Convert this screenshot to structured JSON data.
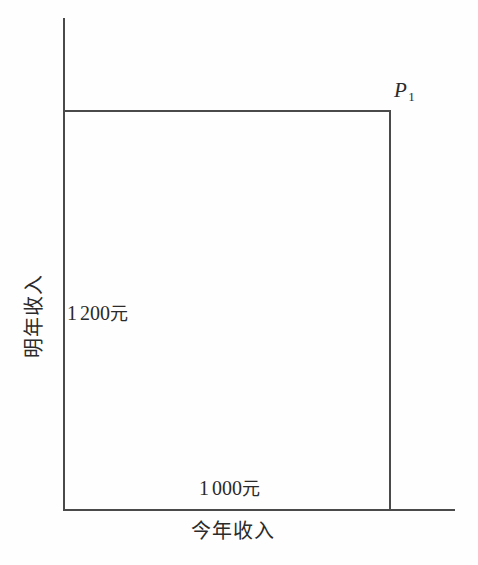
{
  "figure": {
    "background_color": "#fefefe",
    "line_color": "#4a4a4a",
    "text_color": "#2b2b2b"
  },
  "axes": {
    "x_axis_label": "今年收入",
    "y_axis_label": "明年收入"
  },
  "annotations": {
    "corner_point_base": "P",
    "corner_point_subscript": "1",
    "y_value_prefix": "1",
    "y_value_suffix": "200",
    "y_value_unit": "元",
    "x_value_prefix": "1",
    "x_value_suffix": "000",
    "x_value_unit": "元"
  },
  "chart_data": {
    "type": "line",
    "title": "",
    "subtitle": "",
    "xlabel": "今年收入",
    "ylabel": "明年收入",
    "grid": false,
    "legend": "none",
    "annotations": [
      {
        "text": "P₁",
        "role": "endowment-point-label",
        "x": 1000,
        "y": 1200
      },
      {
        "text": "1 200元",
        "role": "y-intercept-value",
        "x": 0,
        "y": 1200
      },
      {
        "text": "1 000元",
        "role": "x-intercept-value",
        "x": 1000,
        "y": 0
      }
    ],
    "series": [
      {
        "name": "endowment-box",
        "kind": "rectangle-outline",
        "points": [
          [
            0,
            1200
          ],
          [
            1000,
            1200
          ],
          [
            1000,
            0
          ]
        ]
      }
    ],
    "xlim": [
      0,
      1200
    ],
    "ylim": [
      0,
      1500
    ],
    "x_tick_labels": [
      "1 000元"
    ],
    "y_tick_labels": [
      "1 200元"
    ]
  }
}
